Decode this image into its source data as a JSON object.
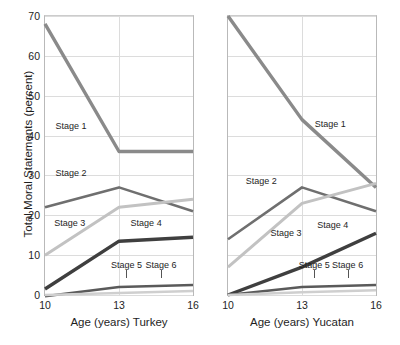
{
  "chart_data": {
    "type": "line",
    "title": "",
    "ylabel": "Total Moral Statements (percent)",
    "ylim": [
      0,
      70
    ],
    "yticks": [
      0,
      10,
      20,
      30,
      40,
      50,
      60,
      70
    ],
    "x": [
      10,
      13,
      16
    ],
    "xticks": [
      "10",
      "13",
      "16"
    ],
    "grid": true,
    "legend": "inline-annotations",
    "panels": [
      {
        "name": "turkey",
        "xlabel": "Age (years) Turkey",
        "show_y_axis_labels": true,
        "series": [
          {
            "name": "Stage 1",
            "values": [
              68,
              36,
              36
            ],
            "color": "#8a8a8a",
            "width": 3.4
          },
          {
            "name": "Stage 2",
            "values": [
              22,
              27,
              21
            ],
            "color": "#6f6f6f",
            "width": 2.6
          },
          {
            "name": "Stage 3",
            "values": [
              10,
              22,
              24
            ],
            "color": "#c2c2c2",
            "width": 3.0
          },
          {
            "name": "Stage 4",
            "values": [
              1.5,
              13.5,
              14.5
            ],
            "color": "#3f3f3f",
            "width": 3.4
          },
          {
            "name": "Stage 5",
            "values": [
              -0.3,
              2,
              2.5
            ],
            "color": "#5a5a5a",
            "width": 2.4
          },
          {
            "name": "Stage 6",
            "values": [
              0,
              0.5,
              1
            ],
            "color": "#cfcfcf",
            "width": 2.4
          }
        ],
        "annotations": [
          {
            "label": "Stage 1",
            "x": 11.05,
            "y": 42.5
          },
          {
            "label": "Stage 2",
            "x": 11.05,
            "y": 30.5
          },
          {
            "label": "Stage 3",
            "x": 11.0,
            "y": 18.0
          },
          {
            "label": "Stage 4",
            "x": 14.1,
            "y": 18.0
          },
          {
            "label": "Stage 5",
            "x": 13.3,
            "y": 7.5,
            "leader": 4.2
          },
          {
            "label": "Stage 6",
            "x": 14.7,
            "y": 7.5,
            "leader": 4.2
          }
        ]
      },
      {
        "name": "yucatan",
        "xlabel": "Age (years) Yucatan",
        "show_y_axis_labels": false,
        "series": [
          {
            "name": "Stage 1",
            "values": [
              70,
              44,
              27
            ],
            "color": "#8a8a8a",
            "width": 3.4
          },
          {
            "name": "Stage 2",
            "values": [
              14,
              27,
              21
            ],
            "color": "#6f6f6f",
            "width": 2.6
          },
          {
            "name": "Stage 3",
            "values": [
              7,
              23,
              28
            ],
            "color": "#c2c2c2",
            "width": 3.0
          },
          {
            "name": "Stage 4",
            "values": [
              0,
              7,
              15.5
            ],
            "color": "#3f3f3f",
            "width": 3.4
          },
          {
            "name": "Stage 5",
            "values": [
              0,
              2,
              2.5
            ],
            "color": "#5a5a5a",
            "width": 2.4
          },
          {
            "name": "Stage 6",
            "values": [
              0,
              0.7,
              1.2
            ],
            "color": "#cfcfcf",
            "width": 2.4
          }
        ],
        "annotations": [
          {
            "label": "Stage 1",
            "x": 14.15,
            "y": 43.0
          },
          {
            "label": "Stage 2",
            "x": 11.35,
            "y": 28.5
          },
          {
            "label": "Stage 3",
            "x": 12.35,
            "y": 15.5
          },
          {
            "label": "Stage 4",
            "x": 14.25,
            "y": 17.5
          },
          {
            "label": "Stage 5",
            "x": 13.5,
            "y": 7.5,
            "leader": 4.2
          },
          {
            "label": "Stage 6",
            "x": 14.85,
            "y": 7.5,
            "leader": 4.2
          }
        ]
      }
    ]
  }
}
